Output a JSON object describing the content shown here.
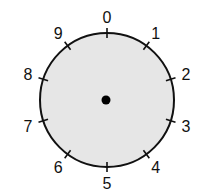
{
  "diagram": {
    "title": "",
    "type": "dial",
    "center": {
      "x": 107,
      "y": 100
    },
    "radius": 67,
    "fill_color": "#e6e6e6",
    "stroke_color": "#111111",
    "center_dot_color": "#000000",
    "labels": [
      "0",
      "1",
      "2",
      "3",
      "4",
      "5",
      "6",
      "7",
      "8",
      "9"
    ]
  }
}
